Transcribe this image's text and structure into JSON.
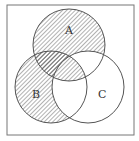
{
  "diagram": {
    "type": "venn",
    "sets": [
      {
        "label": "A",
        "cx": 69,
        "cy": 45,
        "r": 36
      },
      {
        "label": "B",
        "cx": 51,
        "cy": 87,
        "r": 36
      },
      {
        "label": "C",
        "cx": 88,
        "cy": 87,
        "r": 36
      }
    ],
    "shaded_regions": [
      "A only",
      "B only",
      "A∩B (not C)",
      "A∩B∩C"
    ],
    "unshaded_regions": [
      "C only",
      "A∩C (not B)",
      "B∩C (not A)"
    ],
    "colors": {
      "line": "#555555",
      "hatch": "#666666",
      "background": "#ffffff"
    }
  }
}
